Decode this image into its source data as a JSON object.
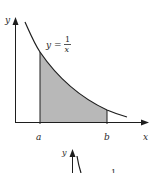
{
  "figure": {
    "main_graph": {
      "y_axis_label": "y",
      "x_axis_label": "x",
      "function_label_lhs": "y =",
      "function_numerator": "1",
      "function_denominator": "x",
      "lower_bound_label": "a",
      "upper_bound_label": "b",
      "shade_color": "#b8b8b8",
      "line_color": "#1e1e1e"
    },
    "partial_graph": {
      "y_axis_label": "y",
      "fragment_text": "1"
    }
  }
}
